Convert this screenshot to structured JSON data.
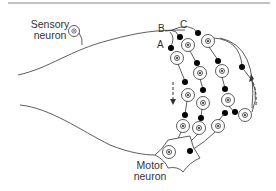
{
  "diagram": {
    "title": "",
    "labels": {
      "sensory_line1": "Sensory",
      "sensory_line2": "neuron",
      "motor_line1": "Motor",
      "motor_line2": "neuron",
      "pathway_a": "A",
      "pathway_b": "B",
      "pathway_c": "C"
    },
    "colors": {
      "line": "#333333",
      "top_rule": "#888888",
      "background": "#ffffff"
    },
    "elements": {
      "sensory_neuron": 1,
      "motor_neuron": 1,
      "interneuron_chains": 3,
      "arrows": [
        "downward dashed (left)",
        "upward dashed (right)"
      ]
    }
  }
}
